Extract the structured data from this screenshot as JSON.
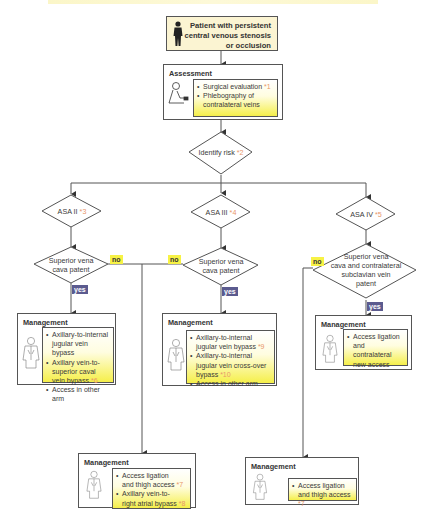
{
  "start": {
    "label": "Patient with persistent central venous stenosis or occlusion",
    "lines": [
      "Patient with persistent",
      "central venous stenosis",
      "or occlusion"
    ],
    "icon": "person-silhouette-icon"
  },
  "assessment": {
    "title": "Assessment",
    "icon": "doctor-examining-icon",
    "items": [
      {
        "text": "Surgical evaluation",
        "ref": "*1"
      },
      {
        "text": "Phlebography of contralateral veins",
        "ref": ""
      }
    ]
  },
  "identify_risk": {
    "text": "Identify risk",
    "ref": "*2"
  },
  "asa": [
    {
      "text": "ASA II",
      "ref": "*3"
    },
    {
      "text": "ASA III",
      "ref": "*4"
    },
    {
      "text": "ASA IV",
      "ref": "*5"
    }
  ],
  "decisions": [
    {
      "lines": [
        "Superior vena",
        "cava patent"
      ]
    },
    {
      "lines": [
        "Superior vena",
        "cava patent"
      ]
    },
    {
      "lines": [
        "Superior vena",
        "cava and contralateral",
        "subclavian vein",
        "patent"
      ]
    }
  ],
  "labels": {
    "no": "no",
    "yes": "yes"
  },
  "management_title": "Management",
  "management": {
    "asa2_yes": {
      "items": [
        {
          "lines": [
            "Axillary-to-internal",
            "jugular vein bypass"
          ],
          "ref": ""
        },
        {
          "lines": [
            "Axillary vein-to-",
            "superior caval",
            "vein bypass"
          ],
          "ref": "*6"
        },
        {
          "lines": [
            "Access in other arm"
          ],
          "ref": ""
        }
      ]
    },
    "asa3_yes": {
      "items": [
        {
          "lines": [
            "Axillary-to-internal",
            "jugular vein bypass"
          ],
          "ref": "*9"
        },
        {
          "lines": [
            "Axillary-to-internal",
            "jugular vein cross-over",
            "bypass"
          ],
          "ref": "*10"
        },
        {
          "lines": [
            "Access in other arm"
          ],
          "ref": ""
        }
      ]
    },
    "asa4_yes": {
      "items": [
        {
          "lines": [
            "Access ligation",
            "and contralateral",
            "new access"
          ],
          "ref": ""
        }
      ]
    },
    "asa23_no": {
      "items": [
        {
          "lines": [
            "Access ligation",
            "and thigh access"
          ],
          "ref": "*7"
        },
        {
          "lines": [
            "Axillary vein-to-",
            "right atrial bypass"
          ],
          "ref": "*8"
        }
      ]
    },
    "asa4_no": {
      "items": [
        {
          "lines": [
            "Access ligation",
            "and thigh access"
          ],
          "ref": "*7"
        }
      ]
    }
  },
  "colors": {
    "line": "#555555",
    "start_fill": "#fbf4d2",
    "no_tag": "#f7f245",
    "yes_tag": "#5b5b8f",
    "ref_text": "#e8966a",
    "highlight_gradient_end": "#f5ef4a"
  }
}
